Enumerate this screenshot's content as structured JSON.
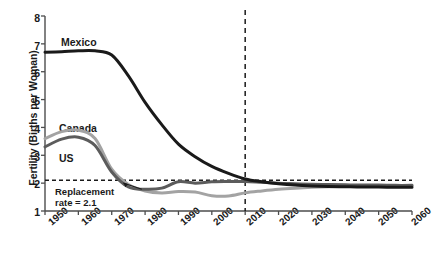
{
  "chart_data": {
    "type": "line",
    "title": "",
    "xlabel": "",
    "ylabel": "Fertility (Births per Woman)",
    "xlim": [
      1950,
      2060
    ],
    "ylim": [
      1,
      8
    ],
    "grid": false,
    "legend_position": "inline-labels",
    "xticks": [
      "1950",
      "1960",
      "1970",
      "1980",
      "1990",
      "2000",
      "2010",
      "2020",
      "2030",
      "2040",
      "2050",
      "2060"
    ],
    "yticks": [
      "1",
      "2",
      "3",
      "4",
      "5",
      "6",
      "7",
      "8"
    ],
    "x": [
      1950,
      1955,
      1960,
      1965,
      1970,
      1975,
      1980,
      1985,
      1990,
      1995,
      2000,
      2005,
      2010,
      2015,
      2020,
      2025,
      2030,
      2035,
      2040,
      2045,
      2050,
      2055,
      2060
    ],
    "series": [
      {
        "name": "Mexico",
        "color": "#1a1a1a",
        "values": [
          6.7,
          6.72,
          6.75,
          6.75,
          6.6,
          5.85,
          4.9,
          4.1,
          3.4,
          2.95,
          2.6,
          2.35,
          2.15,
          2.05,
          1.98,
          1.93,
          1.9,
          1.88,
          1.87,
          1.86,
          1.86,
          1.85,
          1.85
        ]
      },
      {
        "name": "Canada",
        "color": "#a3a3a3",
        "values": [
          3.6,
          3.85,
          3.9,
          3.6,
          2.5,
          1.95,
          1.72,
          1.65,
          1.7,
          1.68,
          1.55,
          1.54,
          1.65,
          1.72,
          1.78,
          1.82,
          1.85,
          1.87,
          1.88,
          1.89,
          1.9,
          1.9,
          1.9
        ]
      },
      {
        "name": "US",
        "color": "#5c5c5c",
        "values": [
          3.3,
          3.58,
          3.65,
          3.35,
          2.4,
          1.86,
          1.78,
          1.82,
          2.05,
          2.0,
          2.05,
          2.06,
          2.06,
          2.03,
          2.0,
          1.98,
          1.96,
          1.95,
          1.94,
          1.93,
          1.93,
          1.92,
          1.92
        ]
      }
    ],
    "reference_lines": [
      {
        "name": "replacement-rate",
        "orientation": "horizontal",
        "value": 2.1,
        "style": "dashed",
        "color": "#1a1a1a",
        "label": "Replacement\nrate = 2.1",
        "label_line1": "Replacement",
        "label_line2": "rate = 2.1"
      },
      {
        "name": "projection-divider",
        "orientation": "vertical",
        "value": 2010,
        "style": "dashed",
        "color": "#1a1a1a",
        "label": ""
      }
    ],
    "series_labels": [
      {
        "name": "Mexico",
        "text": "Mexico"
      },
      {
        "name": "Canada",
        "text": "Canada"
      },
      {
        "name": "US",
        "text": "US"
      }
    ]
  },
  "colors": {
    "background": "#ffffff",
    "axis": "#4d4d4d",
    "text": "#1a1a1a",
    "mexico": "#1a1a1a",
    "canada": "#a3a3a3",
    "us": "#5c5c5c"
  }
}
